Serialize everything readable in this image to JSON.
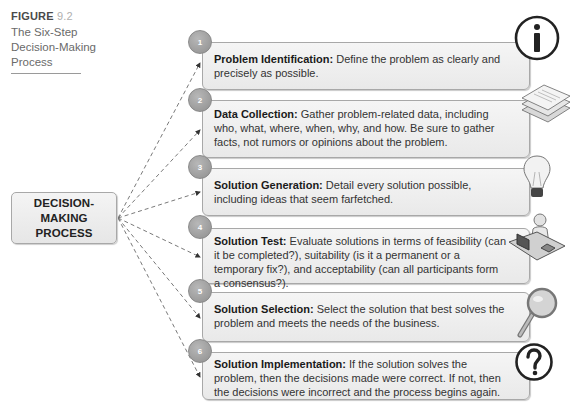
{
  "figure": {
    "label_word": "FIGURE",
    "label_number": "9.2",
    "caption": "The Six-Step Decision-Making Process"
  },
  "center": {
    "line1": "DECISION-MAKING",
    "line2": "PROCESS"
  },
  "steps": [
    {
      "number": "1",
      "title": "Problem Identification:",
      "text": " Define the problem as clearly and precisely as possible.",
      "icon": "info-icon"
    },
    {
      "number": "2",
      "title": "Data Collection:",
      "text": " Gather problem-related data, including who, what, where, when, why, and how.  Be sure to gather facts, not rumors or opinions about the problem.",
      "icon": "stacked-papers-icon"
    },
    {
      "number": "3",
      "title": "Solution Generation:",
      "text": " Detail every solution possible, including ideas that seem farfetched.",
      "icon": "lightbulb-icon"
    },
    {
      "number": "4",
      "title": "Solution Test:",
      "text": " Evaluate solutions in terms of feasibility (can it be completed?), suitability (is it a permanent or a temporary fix?), and acceptability (can all participants form a consensus?).",
      "icon": "person-at-desk-icon"
    },
    {
      "number": "5",
      "title": "Solution Selection:",
      "text": " Select the solution that best solves the problem and meets the needs of the business.",
      "icon": "magnifying-glass-icon"
    },
    {
      "number": "6",
      "title": "Solution Implementation:",
      "text": " If the solution solves the problem, then the decisions made were correct.  If not, then the decisions were incorrect and the process begins again.",
      "icon": "question-mark-icon"
    }
  ]
}
